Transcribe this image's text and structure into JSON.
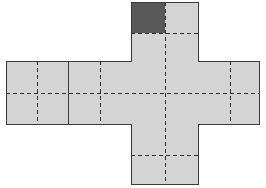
{
  "figure": {
    "type": "geometric-net",
    "canvas": {
      "width": 266,
      "height": 188
    },
    "colors": {
      "cell_fill": "#d4d4d4",
      "shaded_fill": "#595959",
      "outline": "#3a3a3a",
      "divider_solid": "#3a3a3a",
      "divider_dashed": "#2b2b2b",
      "background": "#ffffff"
    },
    "grid": {
      "column_left_x": 131,
      "column_right_x": 199,
      "column_top_y": 2,
      "column_bottom_y": 185,
      "arm_left_x": 6,
      "arm_right_x": 260,
      "arm_top_y": 61,
      "arm_bottom_y": 125,
      "cell_size": 68,
      "center_x": 165,
      "center_y": 93
    },
    "cells": [
      {
        "name": "top-square",
        "x": 131,
        "y": 2,
        "w": 68,
        "h": 59,
        "shaded_quadrant": "top-left"
      },
      {
        "name": "left-outer-square",
        "x": 6,
        "y": 61,
        "w": 62,
        "h": 64,
        "shaded_quadrant": "none"
      },
      {
        "name": "left-inner-square",
        "x": 68,
        "y": 61,
        "w": 63,
        "h": 64,
        "shaded_quadrant": "none"
      },
      {
        "name": "center-square",
        "x": 131,
        "y": 61,
        "w": 68,
        "h": 64,
        "shaded_quadrant": "none"
      },
      {
        "name": "right-square",
        "x": 199,
        "y": 61,
        "w": 61,
        "h": 64,
        "shaded_quadrant": "none"
      },
      {
        "name": "bottom-square",
        "x": 131,
        "y": 125,
        "w": 68,
        "h": 60,
        "shaded_quadrant": "none"
      }
    ],
    "solid_dividers": [
      {
        "name": "left-arm-vertical-divider",
        "x1": 68,
        "y1": 61,
        "x2": 68,
        "y2": 125
      }
    ],
    "dashed_midlines": {
      "vertical_x": 165,
      "horizontal_y": 93,
      "segments": [
        {
          "name": "column-vertical-midline",
          "x1": 165,
          "y1": 2,
          "x2": 165,
          "y2": 185
        },
        {
          "name": "arm-horizontal-midline",
          "x1": 6,
          "y1": 93,
          "x2": 260,
          "y2": 93
        },
        {
          "name": "top-square-horizontal-midline",
          "x1": 131,
          "y1": 33,
          "x2": 199,
          "y2": 33
        },
        {
          "name": "bottom-square-horizontal-midline",
          "x1": 131,
          "y1": 155,
          "x2": 199,
          "y2": 155
        },
        {
          "name": "left-outer-vertical-midline",
          "x1": 37,
          "y1": 61,
          "x2": 37,
          "y2": 125
        },
        {
          "name": "left-inner-vertical-midline",
          "x1": 100,
          "y1": 61,
          "x2": 100,
          "y2": 125
        },
        {
          "name": "right-square-vertical-midline",
          "x1": 230,
          "y1": 61,
          "x2": 230,
          "y2": 125
        }
      ]
    },
    "shaded_square": {
      "name": "shaded-quarter-square",
      "x": 132,
      "y": 3,
      "w": 33,
      "h": 30,
      "fill": "#595959"
    }
  }
}
